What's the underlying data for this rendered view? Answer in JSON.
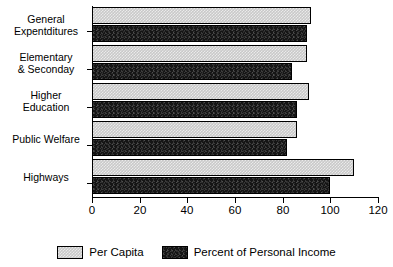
{
  "chart_data": {
    "type": "bar",
    "orientation": "horizontal",
    "title": "",
    "subtitle": "",
    "xlabel": "",
    "ylabel": "",
    "xlim": [
      0,
      120
    ],
    "xticks": [
      0,
      20,
      40,
      60,
      80,
      100,
      120
    ],
    "xtick_labels": [
      "0",
      "20",
      "40",
      "60",
      "80",
      "100",
      "120"
    ],
    "grid": false,
    "legend_position": "bottom",
    "categories": [
      "General\nExpentditures",
      "Elementary\n& Seconday",
      "Higher\nEducation",
      "Public Welfare",
      "Highways"
    ],
    "series": [
      {
        "name": "Per Capita",
        "color": "#c9c9c9",
        "values": [
          92,
          90,
          91,
          86,
          110
        ]
      },
      {
        "name": "Percent of Personal Income",
        "color": "#151515",
        "values": [
          90,
          84,
          86,
          82,
          100
        ]
      }
    ]
  },
  "legend": {
    "entries": [
      {
        "label": "Per Capita"
      },
      {
        "label": "Percent of Personal Income"
      }
    ]
  }
}
